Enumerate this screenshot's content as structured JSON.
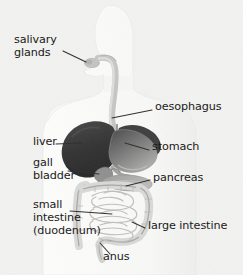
{
  "figure": {
    "background_color": "#f2f2f0",
    "text_color": "#1a1a1a",
    "leader_line_color": "#2b2b2b"
  },
  "palette": {
    "body_silhouette": "#fbfbfa",
    "body_silhouette_edge": "#e8e8e6",
    "oesophagus": "#c9c9c7",
    "liver": "#3a3a3a",
    "stomach": "#6e6e6e",
    "gall_bladder": "#8d8d8d",
    "pancreas": "#a9a9a9",
    "small_intestine": "#d8d8d6",
    "large_intestine": "#cfcfcd",
    "organ_outline": "#9a9a98"
  },
  "labels": [
    {
      "id": "salivary-glands",
      "text": "salivary\nglands",
      "side": "left",
      "x": 14,
      "y": 39
    },
    {
      "id": "oesophagus",
      "text": "oesophagus",
      "side": "right",
      "x": 155,
      "y": 106
    },
    {
      "id": "liver",
      "text": "liver",
      "side": "left",
      "x": 33,
      "y": 140
    },
    {
      "id": "stomach",
      "text": "stomach",
      "side": "right",
      "x": 152,
      "y": 145
    },
    {
      "id": "gall-bladder",
      "text": "gall\nbladder",
      "side": "left",
      "x": 33,
      "y": 159
    },
    {
      "id": "pancreas",
      "text": "pancreas",
      "side": "right",
      "x": 153,
      "y": 176
    },
    {
      "id": "small-intestine",
      "text": "small\nintestine\n(duodenum)",
      "side": "left",
      "x": 33,
      "y": 203
    },
    {
      "id": "large-intestine",
      "text": "large intestine",
      "side": "right",
      "x": 148,
      "y": 224
    },
    {
      "id": "anus",
      "text": "anus",
      "side": "left",
      "x": 103,
      "y": 256
    }
  ],
  "organs": [
    {
      "id": "salivary-glands",
      "name": "salivary glands"
    },
    {
      "id": "oesophagus",
      "name": "oesophagus"
    },
    {
      "id": "liver",
      "name": "liver"
    },
    {
      "id": "stomach",
      "name": "stomach"
    },
    {
      "id": "gall-bladder",
      "name": "gall bladder"
    },
    {
      "id": "pancreas",
      "name": "pancreas"
    },
    {
      "id": "small-intestine",
      "name": "small intestine (duodenum)"
    },
    {
      "id": "large-intestine",
      "name": "large intestine"
    },
    {
      "id": "anus",
      "name": "anus"
    }
  ]
}
